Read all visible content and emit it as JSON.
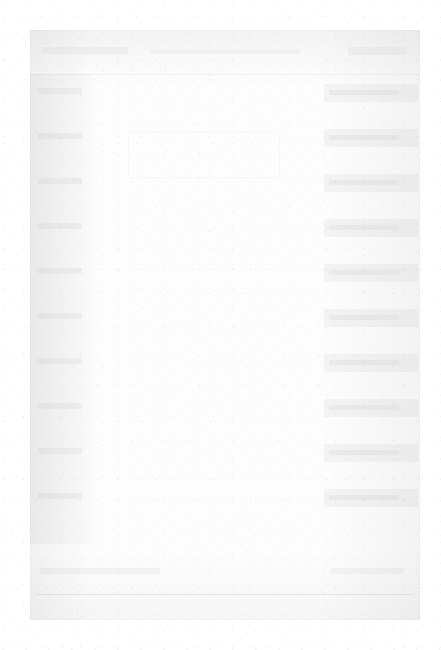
{
  "document": {
    "kind": "faded-scanned-ui",
    "legible_text": "",
    "note": ""
  },
  "header": {
    "title": "",
    "subtitle": "",
    "action_label": ""
  },
  "left_sidebar": {
    "items": [
      {
        "label": ""
      },
      {
        "label": ""
      },
      {
        "label": ""
      },
      {
        "label": ""
      },
      {
        "label": ""
      },
      {
        "label": ""
      },
      {
        "label": ""
      },
      {
        "label": ""
      },
      {
        "label": ""
      },
      {
        "label": ""
      }
    ]
  },
  "main": {
    "body_text": "",
    "block_label": ""
  },
  "right_sidebar": {
    "items": [
      {
        "label": ""
      },
      {
        "label": ""
      },
      {
        "label": ""
      },
      {
        "label": ""
      },
      {
        "label": ""
      },
      {
        "label": ""
      },
      {
        "label": ""
      },
      {
        "label": ""
      },
      {
        "label": ""
      },
      {
        "label": ""
      }
    ]
  },
  "footer": {
    "left_text": "",
    "right_text": ""
  },
  "colors": {
    "page_background": "#ffffff",
    "frame_background": "#fdfdfd",
    "ink_faded": "#d8d8d8",
    "divider": "#bfbfbf"
  }
}
